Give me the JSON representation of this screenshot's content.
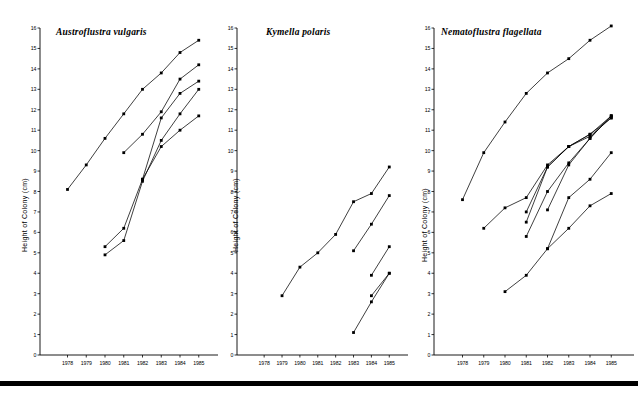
{
  "figure": {
    "bottom_rule": true,
    "panel_count": 3,
    "y_axis_title": "Height of Colony (cm)",
    "ink_color": "#000000",
    "background_color": "#ffffff"
  },
  "chart_data": [
    {
      "type": "line",
      "title": "Austroflustra vulgaris",
      "xlabel": "",
      "ylabel": "Height of Colony (cm)",
      "x": [
        1978,
        1979,
        1980,
        1981,
        1982,
        1983,
        1984,
        1985
      ],
      "xtick_labels": [
        "1978",
        "1979",
        "1980",
        "1981",
        "1982",
        "1983",
        "1984",
        "1985"
      ],
      "ytick_labels": [
        "0",
        "1",
        "2",
        "3",
        "4",
        "5",
        "6",
        "7",
        "8",
        "9",
        "10",
        "11",
        "12",
        "13",
        "14",
        "15",
        "16"
      ],
      "ylim": [
        0,
        16
      ],
      "xlim": [
        1977.6,
        1985.6
      ],
      "grid": false,
      "legend": "none",
      "series": [
        {
          "name": "colony-1",
          "x": [
            1978,
            1979,
            1980,
            1981,
            1982,
            1983,
            1984,
            1985
          ],
          "values": [
            8.1,
            9.3,
            10.6,
            11.8,
            13.0,
            13.8,
            14.8,
            15.4
          ]
        },
        {
          "name": "colony-2",
          "x": [
            1981,
            1982,
            1983,
            1984,
            1985
          ],
          "values": [
            9.9,
            10.8,
            11.9,
            13.5,
            14.2
          ]
        },
        {
          "name": "colony-3",
          "x": [
            1980,
            1981,
            1982,
            1983,
            1984,
            1985
          ],
          "values": [
            5.3,
            6.2,
            8.6,
            11.6,
            12.8,
            13.4
          ]
        },
        {
          "name": "colony-4",
          "x": [
            1980,
            1981,
            1982,
            1983,
            1984,
            1985
          ],
          "values": [
            4.9,
            5.6,
            8.5,
            10.5,
            11.8,
            13.0
          ]
        },
        {
          "name": "colony-5",
          "x": [
            1982,
            1983,
            1984,
            1985
          ],
          "values": [
            8.6,
            10.2,
            11.0,
            11.7
          ]
        }
      ]
    },
    {
      "type": "line",
      "title": "Kymella polaris",
      "xlabel": "",
      "ylabel": "Height of Colony (cm)",
      "x": [
        1978,
        1979,
        1980,
        1981,
        1982,
        1983,
        1984,
        1985
      ],
      "xtick_labels": [
        "1978",
        "1979",
        "1980",
        "1981",
        "1982",
        "1983",
        "1984",
        "1985"
      ],
      "ytick_labels": [
        "0",
        "1",
        "2",
        "3",
        "4",
        "5",
        "6",
        "7",
        "8",
        "9",
        "10",
        "11",
        "12",
        "13",
        "14",
        "15",
        "16"
      ],
      "ylim": [
        0,
        16
      ],
      "xlim": [
        1977.6,
        1985.6
      ],
      "grid": false,
      "legend": "none",
      "series": [
        {
          "name": "colony-1",
          "x": [
            1979,
            1980,
            1981,
            1982,
            1983,
            1984,
            1985
          ],
          "values": [
            2.9,
            4.3,
            5.0,
            5.9,
            7.5,
            7.9,
            9.2
          ]
        },
        {
          "name": "colony-2",
          "x": [
            1983,
            1984,
            1985
          ],
          "values": [
            5.1,
            6.4,
            7.8
          ]
        },
        {
          "name": "colony-3",
          "x": [
            1984,
            1985
          ],
          "values": [
            3.9,
            5.3
          ]
        },
        {
          "name": "colony-4",
          "x": [
            1984,
            1985
          ],
          "values": [
            2.9,
            4.0
          ]
        },
        {
          "name": "colony-5",
          "x": [
            1983,
            1984,
            1985
          ],
          "values": [
            1.1,
            2.6,
            4.0
          ]
        }
      ]
    },
    {
      "type": "line",
      "title": "Nematoflustra flagellata",
      "xlabel": "",
      "ylabel": "Height of Colony (cm)",
      "x": [
        1978,
        1979,
        1980,
        1981,
        1982,
        1983,
        1984,
        1985
      ],
      "xtick_labels": [
        "1978",
        "1979",
        "1980",
        "1981",
        "1982",
        "1983",
        "1984",
        "1985"
      ],
      "ytick_labels": [
        "0",
        "1",
        "2",
        "3",
        "4",
        "5",
        "6",
        "7",
        "8",
        "9",
        "10",
        "11",
        "12",
        "13",
        "14",
        "15",
        "16"
      ],
      "ylim": [
        0,
        16
      ],
      "xlim": [
        1977.6,
        1985.6
      ],
      "grid": false,
      "legend": "none",
      "series": [
        {
          "name": "colony-1",
          "x": [
            1978,
            1979,
            1980,
            1981,
            1982,
            1983,
            1984,
            1985
          ],
          "values": [
            7.6,
            9.9,
            11.4,
            12.8,
            13.8,
            14.5,
            15.4,
            16.1
          ]
        },
        {
          "name": "colony-2",
          "x": [
            1979,
            1980,
            1981,
            1982,
            1983,
            1984,
            1985
          ],
          "values": [
            6.2,
            7.2,
            7.7,
            9.3,
            10.2,
            10.8,
            11.6
          ]
        },
        {
          "name": "colony-3",
          "x": [
            1981,
            1982,
            1983,
            1984,
            1985
          ],
          "values": [
            7.0,
            9.2,
            10.2,
            10.8,
            11.7
          ]
        },
        {
          "name": "colony-4",
          "x": [
            1981,
            1982,
            1983,
            1984,
            1985
          ],
          "values": [
            6.5,
            9.2,
            10.2,
            10.7,
            11.6
          ]
        },
        {
          "name": "colony-5",
          "x": [
            1981,
            1982,
            1983,
            1984,
            1985
          ],
          "values": [
            5.8,
            8.0,
            9.4,
            10.6,
            11.7
          ]
        },
        {
          "name": "colony-6",
          "x": [
            1982,
            1983,
            1984,
            1985
          ],
          "values": [
            7.1,
            9.3,
            10.6,
            11.7
          ]
        },
        {
          "name": "colony-7",
          "x": [
            1982,
            1983,
            1984,
            1985
          ],
          "values": [
            5.2,
            7.7,
            8.6,
            9.9
          ]
        },
        {
          "name": "colony-8",
          "x": [
            1980,
            1981,
            1982,
            1983,
            1984,
            1985
          ],
          "values": [
            3.1,
            3.9,
            5.2,
            6.2,
            7.3,
            7.9
          ]
        }
      ]
    }
  ]
}
